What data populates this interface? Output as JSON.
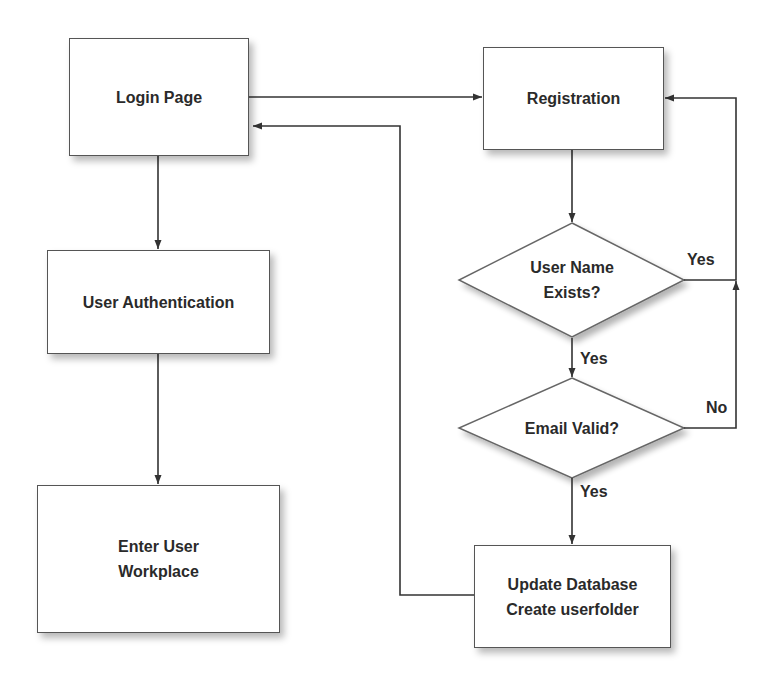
{
  "diagram": {
    "type": "flowchart",
    "nodes": {
      "login_page": {
        "label": "Login Page",
        "shape": "rectangle"
      },
      "registration": {
        "label": "Registration",
        "shape": "rectangle"
      },
      "user_authentication": {
        "label": "User Authentication",
        "shape": "rectangle"
      },
      "enter_workplace": {
        "line1": "Enter User",
        "line2": "Workplace",
        "shape": "rectangle"
      },
      "username_exists": {
        "line1": "User Name",
        "line2": "Exists?",
        "shape": "diamond"
      },
      "email_valid": {
        "label": "Email Valid?",
        "shape": "diamond"
      },
      "update_database": {
        "line1": "Update Database",
        "line2": "Create userfolder",
        "shape": "rectangle"
      }
    },
    "edge_labels": {
      "username_exists_yes_right": "Yes",
      "username_exists_yes_down": "Yes",
      "email_valid_no": "No",
      "email_valid_yes": "Yes"
    },
    "edges": [
      {
        "from": "Login Page",
        "to": "Registration",
        "label": ""
      },
      {
        "from": "Login Page",
        "to": "User Authentication",
        "label": ""
      },
      {
        "from": "User Authentication",
        "to": "Enter User Workplace",
        "label": ""
      },
      {
        "from": "Registration",
        "to": "User Name Exists?",
        "label": ""
      },
      {
        "from": "User Name Exists?",
        "to": "Registration",
        "label": "Yes"
      },
      {
        "from": "User Name Exists?",
        "to": "Email Valid?",
        "label": "Yes"
      },
      {
        "from": "Email Valid?",
        "to": "Registration",
        "label": "No"
      },
      {
        "from": "Email Valid?",
        "to": "Update Database / Create userfolder",
        "label": "Yes"
      },
      {
        "from": "Update Database / Create userfolder",
        "to": "Login Page",
        "label": ""
      }
    ],
    "colors": {
      "stroke": "#444444",
      "text": "#2a2a2a",
      "fill": "#ffffff"
    }
  }
}
